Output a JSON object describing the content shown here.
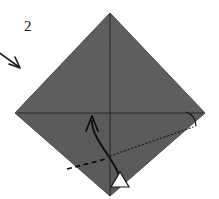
{
  "figure": {
    "step_label": "2",
    "background_color": "#ffffff",
    "paper": {
      "name": "square-paper-diamond",
      "fill_color": "#5a5a5a",
      "edge_color": "#3a3a3a",
      "vertices": {
        "top": [
          110,
          13
        ],
        "right": [
          205,
          113
        ],
        "bottom": [
          110,
          196
        ],
        "left": [
          15,
          113
        ]
      }
    },
    "creases": [
      {
        "name": "vertical-crease",
        "style": "solid",
        "color": "#2b2b2b",
        "from": [
          110,
          14
        ],
        "to": [
          110,
          196
        ]
      },
      {
        "name": "horizontal-crease",
        "style": "solid",
        "color": "#2b2b2b",
        "from": [
          17,
          113
        ],
        "to": [
          203,
          113
        ]
      }
    ],
    "fold_lines": [
      {
        "name": "dotted-fold-line-right",
        "style": "dotted",
        "color": "#1a1a1a",
        "from": [
          110,
          156
        ],
        "to": [
          193,
          127
        ]
      },
      {
        "name": "dashed-fold-line-left",
        "style": "dashed",
        "color": "#000000",
        "from": [
          67,
          169
        ],
        "to": [
          106,
          159
        ]
      }
    ],
    "arrows": [
      {
        "name": "incoming-pointer-arrow",
        "style": "straight",
        "color": "#1a1a1a",
        "from": [
          -2,
          52
        ],
        "to": [
          19,
          67
        ],
        "head": "solid-barbed"
      },
      {
        "name": "fold-motion-arrow",
        "style": "curved",
        "color": "#0d0d0d",
        "from": [
          121,
          180
        ],
        "to": [
          92,
          118
        ],
        "head": "solid-barbed"
      },
      {
        "name": "white-arrowhead-marker",
        "style": "hollow-triangle",
        "fill_color": "#ffffff",
        "stroke_color": "#111111",
        "position": [
          120,
          179
        ],
        "direction": "up"
      },
      {
        "name": "rotation-arc-right",
        "style": "arc",
        "color": "#141414",
        "near_vertex": [
          205,
          113
        ]
      }
    ]
  }
}
